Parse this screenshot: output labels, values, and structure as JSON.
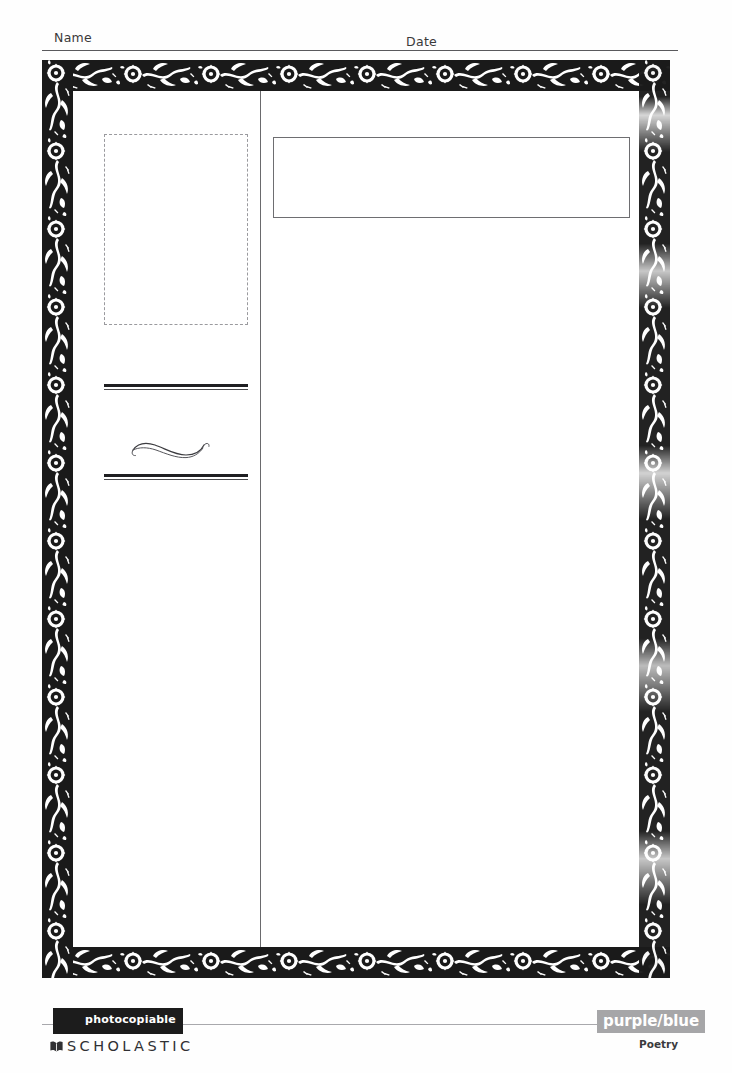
{
  "worksheet": {
    "header": {
      "name_label": "Name",
      "date_label": "Date"
    },
    "body": {
      "picture_box": {
        "name": "picture-placeholder",
        "style": "dashed",
        "value": ""
      },
      "title_box": {
        "name": "title-field",
        "style": "solid",
        "value": ""
      },
      "writing_rules": {
        "upper": "double-rule",
        "lower": "double-rule",
        "ornament": "flourish-swirl"
      }
    },
    "footer": {
      "photocopiable_label": "photocopiable",
      "publisher": "SCHOLASTIC",
      "publisher_icon": "open-book-icon",
      "level_label": "purple/blue",
      "strand_label": "Poetry"
    },
    "colors": {
      "border_ink": "#1a1a1a",
      "rule_gray": "#59595c",
      "dashed_gray": "#9a9a9e",
      "level_box": "#a6a6a8",
      "photocopiable_box": "#1c1c1c",
      "paper": "#ffffff"
    }
  }
}
